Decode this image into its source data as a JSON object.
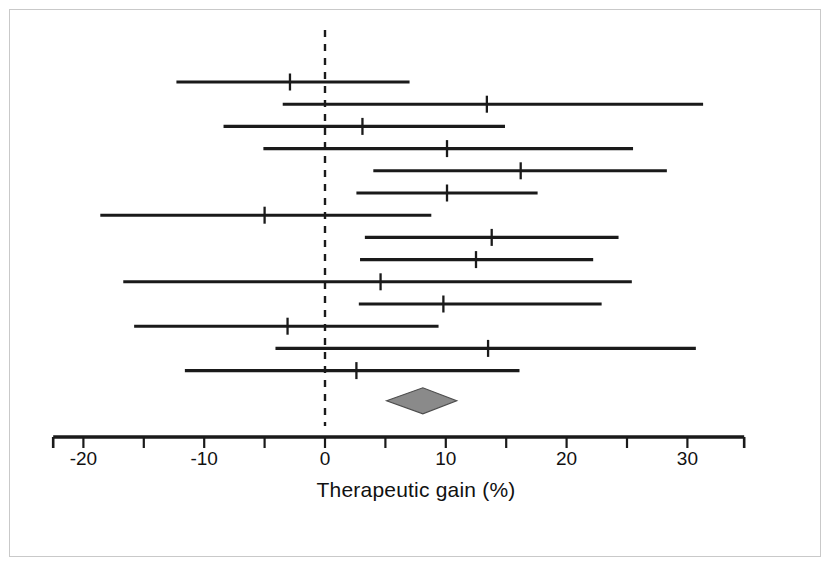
{
  "figure": {
    "kind": "forest-plot",
    "axis_title": "Therapeutic gain (%)",
    "tick_labels": [
      "-20",
      "-10",
      "0",
      "10",
      "20",
      "30"
    ],
    "line_color": "#1a1a1a",
    "frame_color": "#c9c9c9",
    "diamond_fill": "#8a8a8a",
    "null_line_value": "0"
  },
  "chart_data": {
    "type": "scatter",
    "title": "",
    "subtitle": "",
    "xlabel": "Therapeutic gain (%)",
    "ylabel": "",
    "xlim": [
      -22.5,
      34.7
    ],
    "xticks": [
      -20,
      -15,
      -10,
      -5,
      0,
      5,
      10,
      15,
      20,
      25,
      30
    ],
    "xticklabels_shown": [
      -20,
      -10,
      0,
      10,
      20,
      30
    ],
    "grid": false,
    "legend": false,
    "reference_line": 0,
    "reference_line_style": "dashed",
    "series": [
      {
        "name": "Individual trials (point estimate with 95% confidence interval)",
        "points": [
          {
            "row": 1,
            "estimate": -2.9,
            "ci_low": -12.3,
            "ci_high": 7.0
          },
          {
            "row": 2,
            "estimate": 13.4,
            "ci_low": -3.5,
            "ci_high": 31.3
          },
          {
            "row": 3,
            "estimate": 3.1,
            "ci_low": -8.4,
            "ci_high": 14.9
          },
          {
            "row": 4,
            "estimate": 10.1,
            "ci_low": -5.1,
            "ci_high": 25.5
          },
          {
            "row": 5,
            "estimate": 16.2,
            "ci_low": 4.0,
            "ci_high": 28.3
          },
          {
            "row": 6,
            "estimate": 10.1,
            "ci_low": 2.6,
            "ci_high": 17.6
          },
          {
            "row": 7,
            "estimate": -5.0,
            "ci_low": -18.6,
            "ci_high": 8.8
          },
          {
            "row": 8,
            "estimate": 13.8,
            "ci_low": 3.3,
            "ci_high": 24.3
          },
          {
            "row": 9,
            "estimate": 12.5,
            "ci_low": 2.9,
            "ci_high": 22.2
          },
          {
            "row": 10,
            "estimate": 4.6,
            "ci_low": -16.7,
            "ci_high": 25.4
          },
          {
            "row": 11,
            "estimate": 9.8,
            "ci_low": 2.8,
            "ci_high": 22.9
          },
          {
            "row": 12,
            "estimate": -3.1,
            "ci_low": -15.8,
            "ci_high": 9.4
          },
          {
            "row": 13,
            "estimate": 13.5,
            "ci_low": -4.1,
            "ci_high": 30.7
          },
          {
            "row": 14,
            "estimate": 2.6,
            "ci_low": -11.6,
            "ci_high": 16.1
          }
        ]
      }
    ],
    "summary": {
      "name": "Pooled estimate (diamond)",
      "estimate": 8.1,
      "ci_low": 5.1,
      "ci_high": 10.9
    }
  }
}
